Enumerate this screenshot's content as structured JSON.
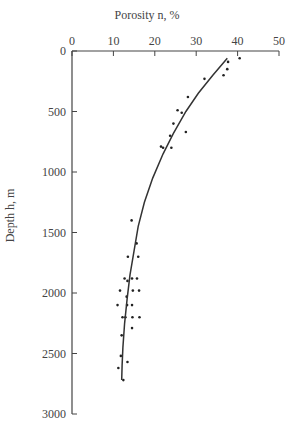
{
  "chart_data": {
    "type": "scatter",
    "title": "Porosity n, %",
    "xlabel": "Porosity n, %",
    "ylabel": "Depth h, m",
    "x_axis_position": "top",
    "y_axis_inverted": true,
    "xlim": [
      0,
      50
    ],
    "ylim": [
      0,
      3000
    ],
    "x_ticks": [
      0,
      10,
      20,
      30,
      40,
      50
    ],
    "y_ticks": [
      0,
      500,
      1000,
      1500,
      2000,
      2500,
      3000
    ],
    "grid": false,
    "legend": null,
    "series": [
      {
        "name": "measured",
        "kind": "scatter",
        "points": [
          [
            40.5,
            60
          ],
          [
            37.7,
            90
          ],
          [
            37.5,
            150
          ],
          [
            36.6,
            200
          ],
          [
            32,
            230
          ],
          [
            28,
            380
          ],
          [
            25.5,
            490
          ],
          [
            26.5,
            510
          ],
          [
            27.5,
            670
          ],
          [
            24.5,
            600
          ],
          [
            23.7,
            700
          ],
          [
            21.5,
            790
          ],
          [
            22,
            800
          ],
          [
            24,
            800
          ],
          [
            14.4,
            1400
          ],
          [
            15.6,
            1590
          ],
          [
            13.5,
            1700
          ],
          [
            16,
            1700
          ],
          [
            12.7,
            1880
          ],
          [
            14.5,
            1880
          ],
          [
            15.7,
            1880
          ],
          [
            13.4,
            1900
          ],
          [
            11.6,
            1980
          ],
          [
            14.7,
            1980
          ],
          [
            16.2,
            1980
          ],
          [
            13.2,
            2030
          ],
          [
            11,
            2100
          ],
          [
            13.3,
            2100
          ],
          [
            14.5,
            2100
          ],
          [
            12.2,
            2200
          ],
          [
            12.9,
            2200
          ],
          [
            14.6,
            2200
          ],
          [
            16.3,
            2200
          ],
          [
            14.5,
            2290
          ],
          [
            12,
            2350
          ],
          [
            11.8,
            2520
          ],
          [
            13.4,
            2570
          ],
          [
            11.2,
            2620
          ],
          [
            12.4,
            2720
          ]
        ]
      },
      {
        "name": "fit",
        "kind": "line",
        "points": [
          [
            37.5,
            60
          ],
          [
            34,
            200
          ],
          [
            30.5,
            350
          ],
          [
            27.5,
            500
          ],
          [
            24.5,
            680
          ],
          [
            22,
            850
          ],
          [
            19.5,
            1050
          ],
          [
            17.5,
            1250
          ],
          [
            16,
            1450
          ],
          [
            15,
            1650
          ],
          [
            14,
            1850
          ],
          [
            13.3,
            2050
          ],
          [
            12.7,
            2250
          ],
          [
            12.3,
            2450
          ],
          [
            12.1,
            2600
          ],
          [
            12,
            2720
          ]
        ]
      }
    ]
  }
}
